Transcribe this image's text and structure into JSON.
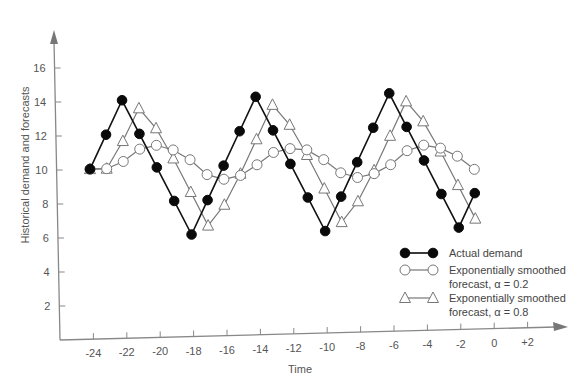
{
  "chart_data": {
    "type": "line",
    "title": "",
    "xlabel": "Time",
    "ylabel": "Historical demand and forecasts",
    "x_ticks": [
      "-24",
      "-22",
      "-20",
      "-18",
      "-16",
      "-14",
      "-12",
      "-10",
      "-8",
      "-6",
      "-4",
      "-2",
      "0",
      "+2"
    ],
    "x_tick_values": [
      -24,
      -22,
      -20,
      -18,
      -16,
      -14,
      -12,
      -10,
      -8,
      -6,
      -4,
      -2,
      0,
      2
    ],
    "y_ticks": [
      "2",
      "4",
      "6",
      "8",
      "10",
      "12",
      "14",
      "16"
    ],
    "y_tick_values": [
      2,
      4,
      6,
      8,
      10,
      12,
      14,
      16
    ],
    "xlim": [
      -26,
      4
    ],
    "ylim": [
      0,
      18
    ],
    "grid": false,
    "legend_position": "lower right",
    "x": [
      -24,
      -23,
      -22,
      -21,
      -20,
      -19,
      -18,
      -17,
      -16,
      -15,
      -14,
      -13,
      -12,
      -11,
      -10,
      -9,
      -8,
      -7,
      -6,
      -5,
      -4,
      -3,
      -2,
      -1
    ],
    "series": [
      {
        "name": "Actual demand",
        "marker": "filled-circle",
        "color": "#111111",
        "values": [
          10,
          12,
          14,
          12,
          10,
          8,
          6,
          8,
          10,
          12,
          14,
          12,
          10,
          8,
          6,
          8,
          10,
          12,
          14,
          12,
          10,
          8,
          6,
          8
        ]
      },
      {
        "name": "Exponentially smoothed forecast, α = 0.2",
        "marker": "open-circle",
        "color": "#777777",
        "values": [
          10,
          10,
          10.4,
          11.1,
          11.3,
          11.0,
          10.4,
          9.5,
          9.2,
          9.4,
          10.0,
          10.7,
          10.9,
          10.8,
          10.2,
          9.4,
          9.1,
          9.3,
          9.8,
          10.6,
          10.9,
          10.7,
          10.2,
          9.4
        ]
      },
      {
        "name": "Exponentially smoothed forecast, α = 0.8",
        "marker": "open-triangle",
        "color": "#777777",
        "values": [
          10,
          10,
          11.6,
          13.5,
          12.3,
          10.5,
          8.5,
          6.5,
          7.7,
          9.5,
          11.5,
          13.5,
          12.3,
          10.5,
          8.5,
          6.5,
          7.7,
          9.5,
          11.5,
          13.5,
          12.3,
          10.5,
          8.5,
          6.5
        ]
      }
    ],
    "legend": [
      {
        "line1": "Actual demand",
        "line2": ""
      },
      {
        "line1": "Exponentially smoothed",
        "line2": "forecast, α = 0.2"
      },
      {
        "line1": "Exponentially smoothed",
        "line2": "forecast, α = 0.8"
      }
    ]
  }
}
